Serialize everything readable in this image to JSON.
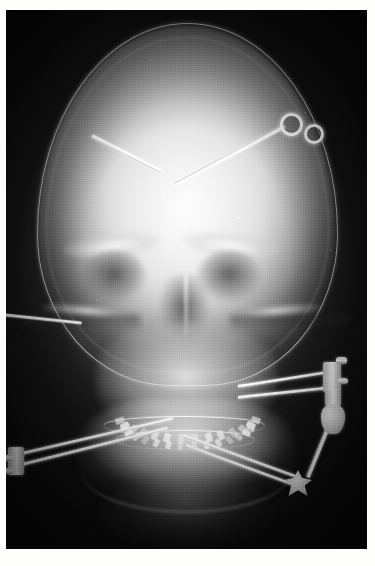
{
  "image": {
    "kind": "radiograph",
    "modality": "X-ray",
    "view": "posteroanterior-skull",
    "width": 375,
    "height": 566,
    "border_color": "#fdfdfb",
    "film_color": "#080808",
    "bone_color": "#f2f2f2",
    "metal_color": "#ffffff",
    "film": {
      "left": 6,
      "top": 10,
      "width": 361,
      "height": 539
    },
    "caption": ""
  },
  "anatomy": {
    "regions": [
      {
        "name": "cranial-vault",
        "label": "Cranial vault"
      },
      {
        "name": "frontal-bone",
        "label": "Frontal bone"
      },
      {
        "name": "orbit-left",
        "label": "Left orbit"
      },
      {
        "name": "orbit-right",
        "label": "Right orbit"
      },
      {
        "name": "nasal-cavity",
        "label": "Nasal cavity"
      },
      {
        "name": "nasal-septum",
        "label": "Nasal septum"
      },
      {
        "name": "maxilla",
        "label": "Maxilla"
      },
      {
        "name": "zygomatic-arch-left",
        "label": "Left zygomatic arch"
      },
      {
        "name": "zygomatic-arch-right",
        "label": "Right zygomatic arch"
      },
      {
        "name": "mandible",
        "label": "Mandible"
      },
      {
        "name": "dental-arch",
        "label": "Dental arch"
      }
    ],
    "teeth": {
      "upper_count": 14,
      "lower_count": 14
    }
  },
  "hardware": {
    "description": "External craniofacial distraction device",
    "cranial_pins": [
      {
        "name": "halo-pin-ring-large",
        "cx": 288,
        "cy": 121,
        "d": 17
      },
      {
        "name": "halo-pin-ring-small",
        "cx": 311,
        "cy": 131,
        "d": 14
      }
    ],
    "rods": [
      {
        "name": "cranial-rod-left",
        "x": 92,
        "y": 134,
        "len": 78,
        "w": 4.2,
        "angle": 27
      },
      {
        "name": "cranial-rod-right",
        "x": 285,
        "y": 124,
        "len": 125,
        "w": 4.0,
        "angle": 152
      },
      {
        "name": "temporal-pin-left",
        "x": 0,
        "y": 313,
        "len": 82,
        "w": 3.2,
        "angle": 6
      },
      {
        "name": "distractor-rod-upper-right",
        "x": 238,
        "y": 385,
        "len": 96,
        "w": 3.2,
        "angle": -9
      },
      {
        "name": "distractor-rod-lower-right",
        "x": 238,
        "y": 396,
        "len": 98,
        "w": 3.4,
        "angle": -6
      },
      {
        "name": "traction-rod-left-upper",
        "x": 22,
        "y": 452,
        "len": 155,
        "w": 3.4,
        "angle": -13
      },
      {
        "name": "traction-rod-left-lower",
        "x": 22,
        "y": 463,
        "len": 150,
        "w": 3.2,
        "angle": -14
      },
      {
        "name": "traction-rod-right-lower",
        "x": 183,
        "y": 434,
        "len": 125,
        "w": 3.4,
        "angle": 20
      },
      {
        "name": "traction-rod-right-lower2",
        "x": 186,
        "y": 444,
        "len": 122,
        "w": 3.2,
        "angle": 20
      },
      {
        "name": "vertical-strut-right",
        "x": 331,
        "y": 418,
        "len": 62,
        "w": 4.0,
        "angle": 112
      }
    ],
    "clamps": [
      {
        "name": "clamp-upper-right",
        "x": 323,
        "y": 362,
        "w": 18,
        "h": 30
      },
      {
        "name": "clamp-mid-right",
        "x": 325,
        "y": 390,
        "w": 16,
        "h": 16
      },
      {
        "name": "clamp-left-outer",
        "x": 8,
        "y": 447,
        "w": 16,
        "h": 28
      }
    ],
    "connectors": [
      {
        "name": "ball-joint-right",
        "x": 321,
        "y": 404,
        "w": 24,
        "h": 30
      },
      {
        "name": "star-connector-right",
        "x": 284,
        "y": 470,
        "w": 28,
        "h": 26
      }
    ],
    "nuts": [
      {
        "name": "nut-upper-right-a",
        "x": 336,
        "y": 357,
        "w": 11,
        "h": 7
      },
      {
        "name": "nut-upper-right-b",
        "x": 338,
        "y": 378,
        "w": 10,
        "h": 6
      },
      {
        "name": "nut-left-a",
        "x": 4,
        "y": 455,
        "w": 9,
        "h": 6
      },
      {
        "name": "nut-left-b",
        "x": 4,
        "y": 468,
        "w": 9,
        "h": 6
      }
    ],
    "arch_bars": [
      {
        "name": "arch-bar-upper",
        "x": 104,
        "y": 416,
        "w": 160,
        "h": 18
      },
      {
        "name": "arch-bar-lower",
        "x": 116,
        "y": 430,
        "w": 138,
        "h": 18
      }
    ]
  },
  "chart_data": null
}
